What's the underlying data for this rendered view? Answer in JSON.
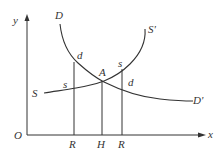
{
  "diagram": {
    "type": "supply-demand",
    "axes": {
      "y_label": "y",
      "x_label": "x",
      "origin_label": "O"
    },
    "curves": {
      "demand": {
        "start_label": "D",
        "end_label": "D'"
      },
      "supply": {
        "start_label": "S",
        "end_label": "S'"
      }
    },
    "points": {
      "equilibrium": "A",
      "demand_left": "d",
      "supply_left": "s",
      "supply_right": "s",
      "demand_right": "d"
    },
    "x_ticks": [
      "R",
      "H",
      "R"
    ]
  }
}
